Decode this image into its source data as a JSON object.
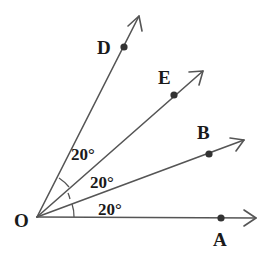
{
  "figure": {
    "vertex": {
      "label": "O",
      "x": 37,
      "y": 217,
      "label_x": 14,
      "label_y": 227
    },
    "rays": [
      {
        "name": "OA",
        "point_label": "A",
        "point": [
          221,
          218
        ],
        "tip": [
          256,
          218
        ],
        "label_pos": [
          213,
          246
        ]
      },
      {
        "name": "OB",
        "point_label": "B",
        "point": [
          209,
          154
        ],
        "tip": [
          244,
          140
        ],
        "label_pos": [
          197,
          139
        ]
      },
      {
        "name": "OE",
        "point_label": "E",
        "point": [
          174,
          95
        ],
        "tip": [
          203,
          71
        ],
        "label_pos": [
          158,
          84
        ]
      },
      {
        "name": "OD",
        "point_label": "D",
        "point": [
          124,
          47
        ],
        "tip": [
          139,
          16
        ],
        "label_pos": [
          97,
          54
        ]
      }
    ],
    "angles": [
      {
        "between": "AOB",
        "label": "20°",
        "label_pos": [
          98,
          215
        ]
      },
      {
        "between": "BOE",
        "label": "20°",
        "label_pos": [
          90,
          188
        ]
      },
      {
        "between": "EOD",
        "label": "20°",
        "label_pos": [
          71,
          160
        ]
      }
    ],
    "colors": {
      "line": "#555555",
      "text": "#1a1a1a",
      "dot": "#333333"
    }
  }
}
